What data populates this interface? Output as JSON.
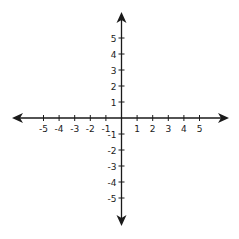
{
  "chart_data": {
    "type": "coordinate-plane",
    "title": "",
    "xlabel": "",
    "ylabel": "",
    "x_ticks": [
      -5,
      -4,
      -3,
      -2,
      -1,
      1,
      2,
      3,
      4,
      5
    ],
    "y_ticks": [
      5,
      4,
      3,
      2,
      1,
      -1,
      -2,
      -3,
      -4,
      -5
    ],
    "xlim": [
      -6.9,
      6.9
    ],
    "ylim": [
      -6.8,
      6.8
    ],
    "grid": false,
    "arrows_on_axes": true,
    "legend": null
  },
  "colors": {
    "axis": "#1a1a1a",
    "background": "#ffffff"
  },
  "layout": {
    "origin_x": 121.5,
    "origin_y": 118,
    "unit_x": 15.6,
    "unit_y": 16,
    "arrow_left_x": 12,
    "arrow_right_x": 229,
    "arrow_top_y": 12,
    "arrow_bottom_y": 226
  }
}
